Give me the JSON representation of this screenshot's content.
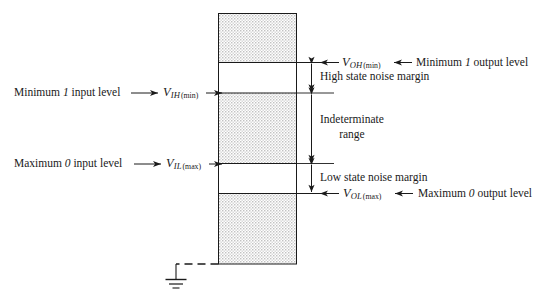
{
  "figure": {
    "name": "logic-voltage-level-noise-margin-diagram",
    "bar": {
      "regions": [
        {
          "name": "upper-forbidden-shaded",
          "kind": "stippled"
        },
        {
          "name": "high-state-noise-margin-band",
          "kind": "white"
        },
        {
          "name": "indeterminate-shaded",
          "kind": "stippled"
        },
        {
          "name": "low-state-noise-margin-band",
          "kind": "white"
        },
        {
          "name": "lower-shaded",
          "kind": "stippled"
        }
      ]
    },
    "left_labels": [
      {
        "text": "Minimum ",
        "emph": "1",
        "text_tail": " input level",
        "symbol_v": "V",
        "symbol_sub": "IH",
        "symbol_paren": "(min)"
      },
      {
        "text": "Maximum ",
        "emph": "0",
        "text_tail": " input level",
        "symbol_v": "V",
        "symbol_sub": "IL",
        "symbol_paren": "(max)"
      }
    ],
    "right_labels": [
      {
        "symbol_v": "V",
        "symbol_sub": "OH",
        "symbol_paren": "(min)",
        "text": "Minimum ",
        "emph": "1",
        "text_tail": " output level"
      },
      {
        "symbol_v": "V",
        "symbol_sub": "OL",
        "symbol_paren": "(max)",
        "text": "Maximum ",
        "emph": "0",
        "text_tail": " output level"
      }
    ],
    "dimensions": [
      {
        "name": "high-state-noise-margin",
        "label": "High state noise margin"
      },
      {
        "name": "indeterminate-range",
        "label_line1": "Indeterminate",
        "label_line2": "range"
      },
      {
        "name": "low-state-noise-margin",
        "label": "Low state noise margin"
      }
    ],
    "ground": {
      "name": "ground-symbol",
      "label": ""
    },
    "colors": {
      "line": "#1a1a1a",
      "stipple": "#b9b9b9",
      "background": "#ffffff",
      "text": "#1a1a1a"
    }
  }
}
